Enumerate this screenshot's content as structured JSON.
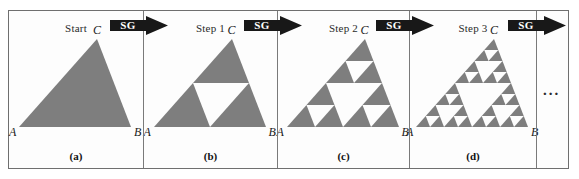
{
  "figure": {
    "caption_style": "sierpinski-gasket-construction",
    "gray": "#7e7e7e",
    "ink": "#1a1a1a",
    "border": "#6f6f6f",
    "ellipsis": "...",
    "panels": [
      {
        "step_label": "Start",
        "caption": "(a)",
        "depth": 0,
        "vertices": {
          "a": "A",
          "b": "B",
          "c": "C"
        }
      },
      {
        "step_label": "Step 1",
        "caption": "(b)",
        "depth": 1,
        "vertices": {
          "a": "A",
          "b": "B",
          "c": "C"
        }
      },
      {
        "step_label": "Step 2",
        "caption": "(c)",
        "depth": 2,
        "vertices": {
          "a": "A",
          "b": "B",
          "c": "C"
        }
      },
      {
        "step_label": "Step 3",
        "caption": "(d)",
        "depth": 3,
        "vertices": {
          "a": "A",
          "b": "B",
          "c": "C"
        }
      }
    ],
    "arrows": [
      {
        "label": "SG"
      },
      {
        "label": "SG"
      },
      {
        "label": "SG"
      },
      {
        "label": "SG"
      }
    ]
  }
}
